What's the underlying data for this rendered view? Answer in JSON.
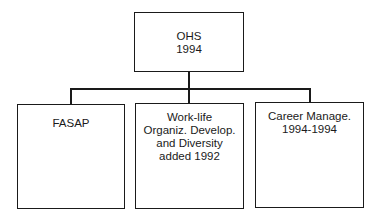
{
  "root": {
    "lines": [
      "OHS",
      "1994"
    ]
  },
  "children": [
    {
      "lines": [
        "FASAP"
      ]
    },
    {
      "lines": [
        "Work-life",
        "Organiz. Develop.",
        "and Diversity",
        "added 1992"
      ]
    },
    {
      "lines": [
        "Career Manage.",
        "1994-1994"
      ]
    }
  ]
}
